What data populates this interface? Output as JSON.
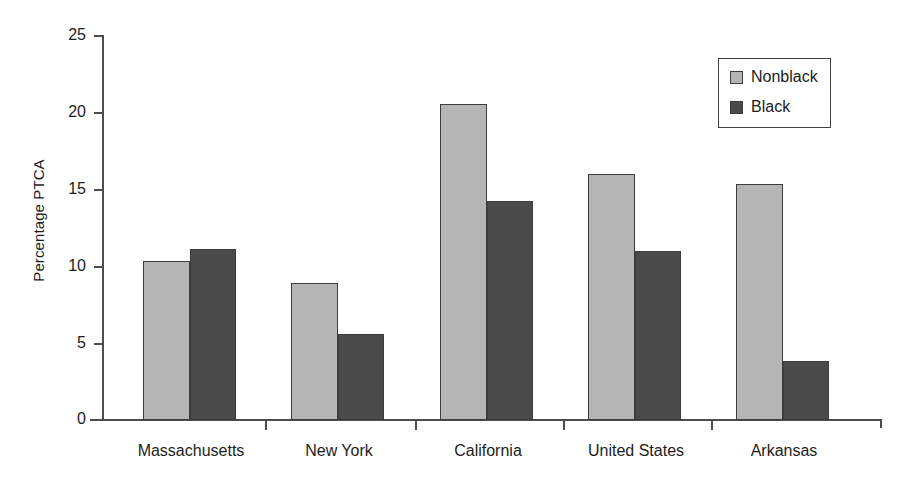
{
  "chart_data": {
    "type": "bar",
    "title": "",
    "subtitle": "",
    "xlabel": "",
    "ylabel": "Percentage PTCA",
    "categories": [
      "Massachusetts",
      "New York",
      "California",
      "United States",
      "Arkansas"
    ],
    "series": [
      {
        "name": "Nonblack",
        "color": "#b5b5b5",
        "values": [
          10.3,
          8.9,
          20.5,
          16.0,
          15.3
        ]
      },
      {
        "name": "Black",
        "color": "#4a4a4a",
        "values": [
          11.1,
          5.6,
          14.2,
          11.0,
          3.8
        ]
      }
    ],
    "ylim": [
      0,
      25
    ],
    "yticks": [
      0,
      5,
      10,
      15,
      20,
      25
    ],
    "ytick_labels": [
      "0",
      "5",
      "10",
      "15",
      "20",
      "25"
    ],
    "grid": false,
    "legend_position": "top-right",
    "legend_entries": [
      "Nonblack",
      "Black"
    ]
  },
  "axis": {
    "y_title": "Percentage PTCA",
    "tick_labels": [
      "25",
      "20",
      "15",
      "10",
      "5",
      "0"
    ]
  },
  "legend": {
    "items": [
      {
        "label": "Nonblack",
        "swatch": "legend-swatch-nonblack-icon"
      },
      {
        "label": "Black",
        "swatch": "legend-swatch-black-icon"
      }
    ]
  }
}
